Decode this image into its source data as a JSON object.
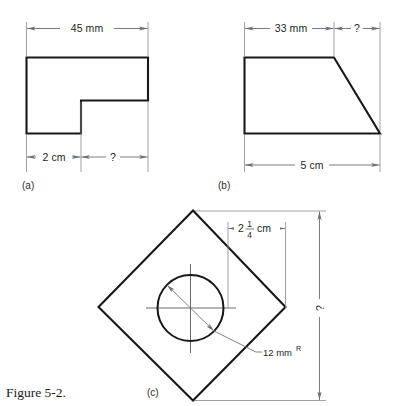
{
  "figure": {
    "caption": "Figure 5-2.",
    "background_color": "#ffffff",
    "object_line_color": "#17181a",
    "dimension_line_color": "#70757b",
    "parts": [
      {
        "key": "a",
        "label": "(a)",
        "shape": "L-shaped-block",
        "dimensions": [
          {
            "name": "overall-width",
            "text": "45 mm",
            "position": "top"
          },
          {
            "name": "left-segment-width",
            "text": "2 cm",
            "position": "bottom-left"
          },
          {
            "name": "unknown-width",
            "text": "?",
            "position": "bottom-right"
          }
        ]
      },
      {
        "key": "b",
        "label": "(b)",
        "shape": "trapezoid-block",
        "dimensions": [
          {
            "name": "top-width",
            "text": "33 mm",
            "position": "top-left"
          },
          {
            "name": "unknown-width",
            "text": "?",
            "position": "top-right"
          },
          {
            "name": "overall-base-width",
            "text": "5 cm",
            "position": "bottom"
          }
        ]
      },
      {
        "key": "c",
        "label": "(c)",
        "shape": "diamond-plate-with-hole",
        "dimensions": [
          {
            "name": "center-offset",
            "text": "2 ",
            "whole": "2",
            "numerator": "1",
            "denominator": "4",
            "unit": "cm",
            "position": "top"
          },
          {
            "name": "hole-radius",
            "text": "12 mm",
            "superscript": "R",
            "position": "leader-bottom-right"
          },
          {
            "name": "unknown-height",
            "text": "?",
            "position": "right-vertical"
          }
        ]
      }
    ]
  }
}
